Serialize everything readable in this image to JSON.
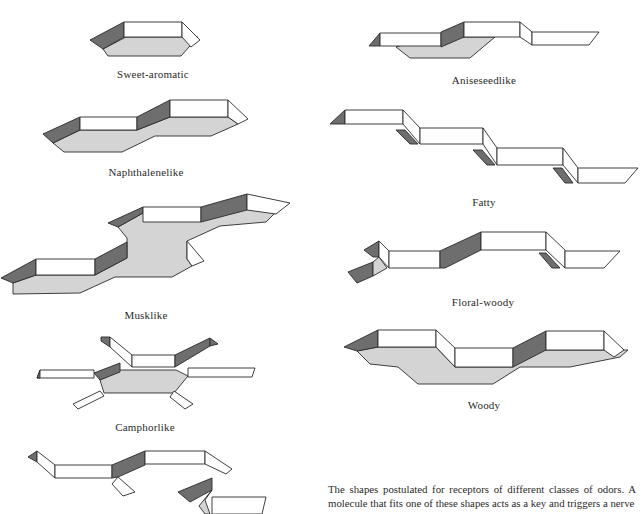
{
  "figure": {
    "shapes": [
      {
        "id": "sweet-aromatic",
        "label": "Sweet-aromatic"
      },
      {
        "id": "naphthalenelike",
        "label": "Naphthalenelike"
      },
      {
        "id": "musklike",
        "label": "Musklike"
      },
      {
        "id": "camphorlike",
        "label": "Camphorlike"
      },
      {
        "id": "unlabeled-bottom-left",
        "label": ""
      },
      {
        "id": "aniseseedlike",
        "label": "Aniseseedlike"
      },
      {
        "id": "fatty",
        "label": "Fatty"
      },
      {
        "id": "floral-woody",
        "label": "Floral-woody"
      },
      {
        "id": "woody",
        "label": "Woody"
      }
    ],
    "colors": {
      "wall": "#ffffff",
      "shadow_wall": "#6e6e6e",
      "floor": "#d4d4d4",
      "outline": "#2a2a2a"
    }
  },
  "caption": {
    "text": "The shapes postulated for receptors of different classes of odors. A molecule that fits one of these shapes acts as a key and triggers a nerve"
  }
}
